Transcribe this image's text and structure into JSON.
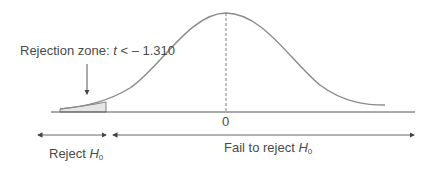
{
  "diagram": {
    "rejection_label": {
      "prefix": "Rejection zone: ",
      "variable": "t",
      "relation": " < – 1.310"
    },
    "axis_tick": "0",
    "reject_label": {
      "text": "Reject ",
      "symbol": "H",
      "subscript": "0"
    },
    "fail_label": {
      "text": "Fail to reject ",
      "symbol": "H",
      "subscript": "0"
    },
    "critical_value": -1.31,
    "colors": {
      "curve": "#8a8a8a",
      "axis": "#555555",
      "shade": "#e6e6e6",
      "text": "#4a4a4a"
    }
  }
}
